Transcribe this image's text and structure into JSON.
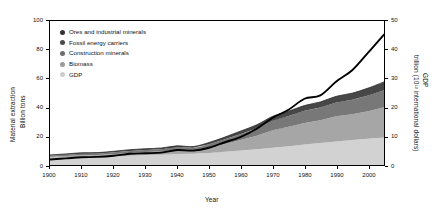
{
  "chart_data": {
    "type": "area",
    "title": "",
    "xlabel": "Year",
    "ylabel": "Material extraction Billion tons",
    "y2label": "GDP trillion (10¹² international dollars)",
    "xlim": [
      1900,
      2005
    ],
    "ylim": [
      0,
      100
    ],
    "y2lim": [
      0,
      50
    ],
    "grid": false,
    "legend_position": "upper-left",
    "stacked": true,
    "x": [
      1900,
      1905,
      1910,
      1915,
      1920,
      1925,
      1930,
      1935,
      1940,
      1945,
      1950,
      1955,
      1960,
      1965,
      1970,
      1975,
      1980,
      1985,
      1990,
      1995,
      2000,
      2005
    ],
    "series": [
      {
        "name": "Biomass",
        "color": "#d2d2d2",
        "axis": "left",
        "values": [
          5.0,
          5.3,
          5.6,
          5.8,
          6.1,
          6.5,
          6.9,
          7.2,
          7.6,
          7.9,
          8.4,
          9.2,
          10.0,
          11.0,
          12.0,
          13.1,
          14.2,
          15.3,
          16.4,
          17.3,
          18.2,
          19.1
        ]
      },
      {
        "name": "Construction minerals",
        "color": "#a6a6a6",
        "axis": "left",
        "values": [
          0.8,
          1.0,
          1.2,
          1.1,
          1.4,
          1.9,
          2.1,
          2.2,
          2.7,
          2.2,
          3.6,
          5.4,
          7.4,
          9.3,
          12.2,
          13.5,
          15.0,
          15.8,
          17.4,
          18.0,
          19.2,
          21.0
        ]
      },
      {
        "name": "Fossil energy carriers",
        "color": "#787878",
        "axis": "left",
        "values": [
          0.8,
          0.9,
          1.1,
          1.1,
          1.3,
          1.4,
          1.5,
          1.6,
          2.0,
          1.8,
          2.4,
          3.2,
          4.2,
          5.2,
          6.6,
          7.4,
          8.4,
          8.8,
          9.6,
          10.0,
          10.9,
          11.8
        ]
      },
      {
        "name": "Ores and industrial minerals",
        "color": "#474747",
        "axis": "left",
        "values": [
          0.4,
          0.5,
          0.6,
          0.6,
          0.7,
          0.8,
          0.8,
          0.8,
          1.0,
          0.9,
          1.2,
          1.6,
          2.0,
          2.4,
          3.0,
          3.3,
          3.7,
          3.9,
          4.3,
          4.6,
          5.1,
          5.8
        ]
      }
    ],
    "line_series": [
      {
        "name": "GDP",
        "color": "#000000",
        "axis": "right",
        "values": [
          1.9,
          2.3,
          2.7,
          2.8,
          3.2,
          3.9,
          4.1,
          4.3,
          5.2,
          5.0,
          6.0,
          7.9,
          9.8,
          12.6,
          16.4,
          19.2,
          23.0,
          24.2,
          29.0,
          32.9,
          39.0,
          45.3
        ]
      }
    ],
    "y_ticks_left": [
      0,
      20,
      40,
      60,
      80,
      100
    ],
    "y_ticks_right": [
      0,
      10,
      20,
      30,
      40,
      50
    ],
    "x_ticks": [
      1900,
      1910,
      1920,
      1930,
      1940,
      1950,
      1960,
      1970,
      1980,
      1990,
      2000
    ]
  },
  "legend": {
    "items": [
      {
        "label": "Ores and industrial minerals",
        "color": "#333333"
      },
      {
        "label": "Fossil energy carriers",
        "color": "#4a4a4a"
      },
      {
        "label": "Construction minerals",
        "color": "#6e6e6e"
      },
      {
        "label": "Biomass",
        "color": "#9a9a9a"
      },
      {
        "label": "GDP",
        "color": "#cdcdcd"
      }
    ]
  },
  "axes": {
    "left_title_line1": "Material extraction",
    "left_title_line2": "Billion tons",
    "right_title_line1": "GDP",
    "right_title_line2": "trillion (10¹² international dollars)",
    "x_title": "Year"
  }
}
